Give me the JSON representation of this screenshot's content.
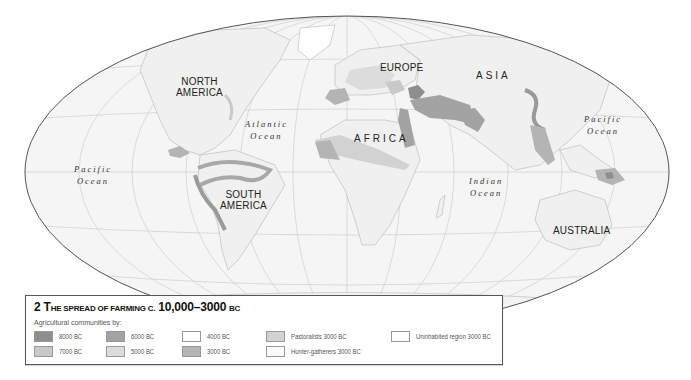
{
  "map": {
    "projection": "ellipse",
    "colors": {
      "ocean": "#f4f4f4",
      "land": "#f0f0f0",
      "outline": "#555555",
      "graticule": "#c8c8c8",
      "coast": "#b8b8b8"
    },
    "continent_labels": [
      {
        "id": "north-america",
        "line1": "NORTH",
        "line2": "AMERICA"
      },
      {
        "id": "south-america",
        "line1": "SOUTH",
        "line2": "AMERICA"
      },
      {
        "id": "europe",
        "line1": "EUROPE"
      },
      {
        "id": "asia",
        "line1": "ASIA"
      },
      {
        "id": "africa",
        "line1": "AFRICA"
      },
      {
        "id": "australia",
        "line1": "AUSTRALIA"
      }
    ],
    "ocean_labels": [
      {
        "id": "pacific-west",
        "line1": "Pacific",
        "line2": "Ocean"
      },
      {
        "id": "atlantic",
        "line1": "Atlantic",
        "line2": "Ocean"
      },
      {
        "id": "indian",
        "line1": "Indian",
        "line2": "Ocean"
      },
      {
        "id": "pacific-east",
        "line1": "Pacific",
        "line2": "Ocean"
      }
    ]
  },
  "legend": {
    "number": "2",
    "title_first_letter": "T",
    "title_rest_smallcaps": "he spread of farming c.",
    "title_years": "10,000–3000",
    "title_era": "bc",
    "subtitle": "Agricultural communities by:",
    "items": [
      {
        "id": "8000bc",
        "label": "8000 BC",
        "color": "#8e8e8e"
      },
      {
        "id": "7000bc",
        "label": "7000 BC",
        "color": "#c9c9c9"
      },
      {
        "id": "6000bc",
        "label": "6000 BC",
        "color": "#a3a3a3"
      },
      {
        "id": "5000bc",
        "label": "5000 BC",
        "color": "#dcdcdc"
      },
      {
        "id": "4000bc",
        "label": "4000 BC",
        "color": "#ffffff"
      },
      {
        "id": "3000bc",
        "label": "3000 BC",
        "color": "#b4b4b4"
      },
      {
        "id": "pastoralists",
        "label": "Pastoralists 3000 BC",
        "color": "#d2d2d2"
      },
      {
        "id": "hunter-gatherers",
        "label": "Hunter-gatherers 3000 BC",
        "color": "#fafafa"
      },
      {
        "id": "uninhabited",
        "label": "Uninhabited region 3000 BC",
        "color": "#ffffff"
      }
    ]
  }
}
